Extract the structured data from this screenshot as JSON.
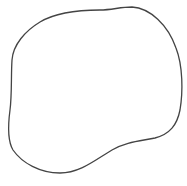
{
  "canvas": {
    "width": 187,
    "height": 186,
    "background": "#ffffff"
  },
  "shape": {
    "type": "closed-blob-outline",
    "stroke": "#444444",
    "stroke_width": 1.3,
    "fill": "none",
    "path": "M 40 22 C 55 13, 75 10, 100 10 C 112 10, 120 7, 132 7 C 150 8, 168 25, 176 48 C 183 66, 183 92, 180 110 C 177 125, 170 134, 155 138 C 140 141, 125 142, 112 150 C 95 160, 80 173, 60 173 C 40 173, 22 163, 13 150 C 7 140, 8 125, 10 110 C 12 95, 11 75, 12 60 C 13 45, 25 31, 40 22 Z"
  }
}
